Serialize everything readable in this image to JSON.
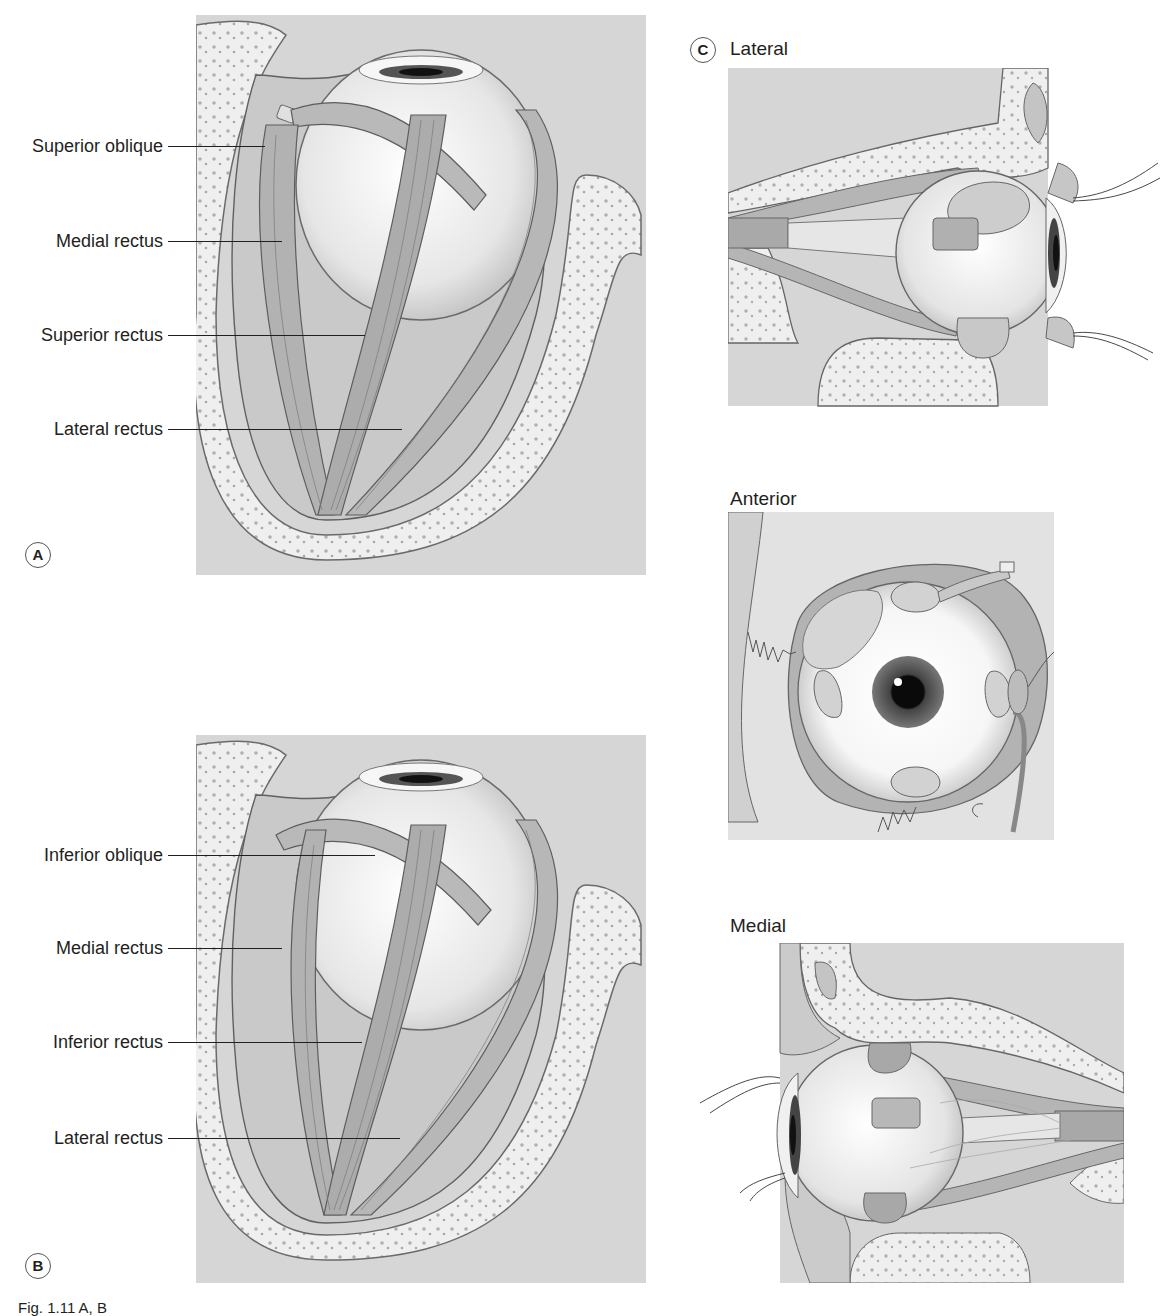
{
  "figure": {
    "panels": {
      "A": {
        "badge": "A",
        "labels": [
          {
            "text": "Superior oblique"
          },
          {
            "text": "Medial rectus"
          },
          {
            "text": "Superior rectus"
          },
          {
            "text": "Lateral rectus"
          }
        ]
      },
      "B": {
        "badge": "B",
        "labels": [
          {
            "text": "Inferior oblique"
          },
          {
            "text": "Medial rectus"
          },
          {
            "text": "Inferior rectus"
          },
          {
            "text": "Lateral rectus"
          }
        ]
      },
      "C": {
        "badge": "C",
        "views": [
          {
            "title": "Lateral"
          },
          {
            "title": "Anterior"
          },
          {
            "title": "Medial"
          }
        ]
      }
    },
    "caption": "Fig. 1.11 A, B"
  },
  "colors": {
    "background_tissue": "#d9d9d9",
    "bone": "#eeeeee",
    "muscle": "#b5b5b5",
    "muscle_dark": "#9a9a9a",
    "outline": "#5a5a5a",
    "globe": "#f4f4f4",
    "text": "#231f20"
  }
}
